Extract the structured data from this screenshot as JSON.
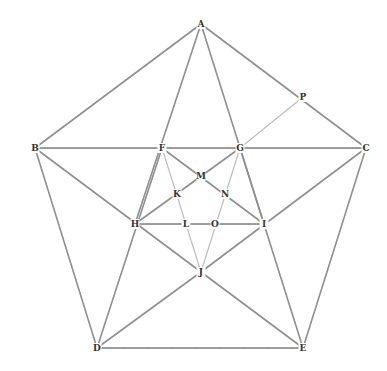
{
  "diagram": {
    "type": "geometric-construction",
    "points": {
      "A": {
        "label": "A",
        "x": 201,
        "y": 24
      },
      "B": {
        "label": "B",
        "x": 35,
        "y": 148
      },
      "C": {
        "label": "C",
        "x": 366,
        "y": 148
      },
      "D": {
        "label": "D",
        "x": 97,
        "y": 348
      },
      "E": {
        "label": "E",
        "x": 303,
        "y": 348
      },
      "F": {
        "label": "F",
        "x": 162,
        "y": 148
      },
      "G": {
        "label": "G",
        "x": 240,
        "y": 148
      },
      "H": {
        "label": "H",
        "x": 135,
        "y": 224
      },
      "I": {
        "label": "I",
        "x": 264,
        "y": 224
      },
      "J": {
        "label": "J",
        "x": 201,
        "y": 272
      },
      "K": {
        "label": "K",
        "x": 177,
        "y": 194
      },
      "L": {
        "label": "L",
        "x": 186,
        "y": 224
      },
      "M": {
        "label": "M",
        "x": 201,
        "y": 176
      },
      "N": {
        "label": "N",
        "x": 225,
        "y": 194
      },
      "O": {
        "label": "O",
        "x": 215,
        "y": 224
      },
      "P": {
        "label": "P",
        "x": 303,
        "y": 97
      }
    },
    "segments": [
      {
        "from": "A",
        "to": "B",
        "style": "solid"
      },
      {
        "from": "A",
        "to": "C",
        "style": "solid"
      },
      {
        "from": "B",
        "to": "D",
        "style": "solid"
      },
      {
        "from": "C",
        "to": "E",
        "style": "solid"
      },
      {
        "from": "D",
        "to": "E",
        "style": "dotted"
      },
      {
        "from": "B",
        "to": "C",
        "style": "dotted"
      },
      {
        "from": "A",
        "to": "H",
        "style": "solid"
      },
      {
        "from": "A",
        "to": "I",
        "style": "solid"
      },
      {
        "from": "B",
        "to": "J",
        "style": "solid"
      },
      {
        "from": "C",
        "to": "J",
        "style": "solid"
      },
      {
        "from": "D",
        "to": "F",
        "style": "solid"
      },
      {
        "from": "E",
        "to": "G",
        "style": "solid"
      },
      {
        "from": "D",
        "to": "J",
        "style": "solid"
      },
      {
        "from": "E",
        "to": "J",
        "style": "solid"
      },
      {
        "from": "H",
        "to": "I",
        "style": "dotted"
      },
      {
        "from": "F",
        "to": "I",
        "style": "solid"
      },
      {
        "from": "G",
        "to": "H",
        "style": "solid"
      },
      {
        "from": "F",
        "to": "J",
        "style": "light"
      },
      {
        "from": "G",
        "to": "J",
        "style": "light"
      },
      {
        "from": "G",
        "to": "P",
        "style": "light"
      }
    ]
  }
}
